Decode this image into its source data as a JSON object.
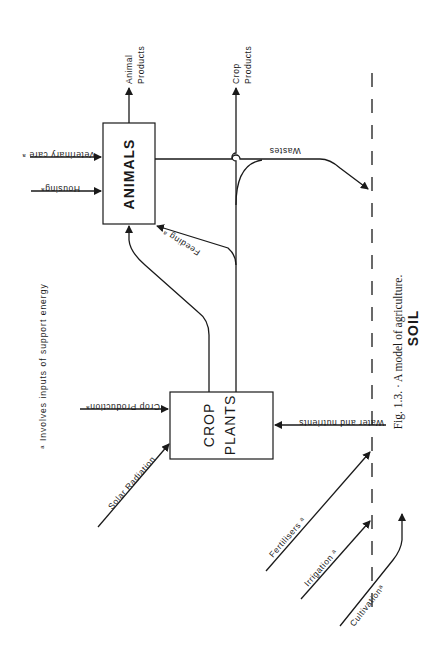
{
  "figure": {
    "caption": "Fig. 1.3. · A model of agriculture.",
    "footnote": "ᵃ Involves inputs of support energy",
    "soil_label": "SOIL"
  },
  "nodes": {
    "animals": {
      "label": "ANIMALS"
    },
    "crop_plants": {
      "line1": "CROP",
      "line2": "PLANTS"
    }
  },
  "inputs": {
    "veterinary_care": "Veterinary care ᵃ",
    "housing": "Housingᵃ",
    "crop_production": "Crop Productionᵃ",
    "solar_radiation": "Solar Radiation",
    "fertilisers": "Fertilisers ᵃ",
    "irrigation": "Irrigation ᵃ",
    "cultivation": "Cultivationᵃ",
    "water_nutrients": "Water and nutrients"
  },
  "outputs": {
    "animal_products_1": "Animal",
    "animal_products_2": "Products",
    "crop_products_1": "Crop",
    "crop_products_2": "Products",
    "wastes": "Wastes",
    "feeding": "Feeding ᵃ"
  }
}
